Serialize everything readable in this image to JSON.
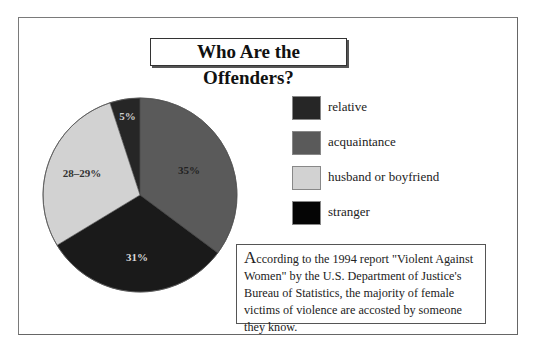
{
  "title": "Who Are the Offenders?",
  "legend": [
    {
      "label": "relative",
      "color": "#262626"
    },
    {
      "label": "acquaintance",
      "color": "#5a5a5a"
    },
    {
      "label": "husband or boyfriend",
      "color": "#d2d2d2"
    },
    {
      "label": "stranger",
      "color": "#050505"
    }
  ],
  "slice_labels": {
    "relative": "5%",
    "acquaintance": "35%",
    "stranger": "31%",
    "husband": "28–29%"
  },
  "note": {
    "first_letter": "A",
    "text": "ccording to the 1994 report \"Violent Against Women\" by the U.S. Department of Justice's Bureau of Statistics, the majority of female victims of violence are accosted by someone they know."
  },
  "chart_data": {
    "type": "pie",
    "title": "Who Are the Offenders?",
    "categories": [
      "relative",
      "acquaintance",
      "stranger",
      "husband or boyfriend"
    ],
    "values": [
      5,
      35,
      31,
      28.5
    ],
    "value_labels": [
      "5%",
      "35%",
      "31%",
      "28–29%"
    ],
    "colors": [
      "#262626",
      "#5a5a5a",
      "#1a1a1a",
      "#d2d2d2"
    ],
    "legend_position": "right",
    "annotation": "According to the 1994 report \"Violent Against Women\" by the U.S. Department of Justice's Bureau of Statistics, the majority of female victims of violence are accosted by someone they know."
  }
}
